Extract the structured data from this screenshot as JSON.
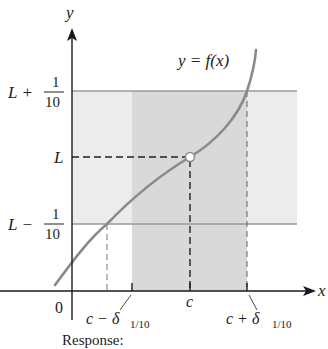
{
  "diagram": {
    "axes": {
      "x_label": "x",
      "y_label": "y",
      "origin_label": "0"
    },
    "curve_label": "y = f(x)",
    "y_levels": {
      "upper": {
        "prefix": "L +",
        "num": "1",
        "den": "10"
      },
      "middle": {
        "label": "L"
      },
      "lower": {
        "prefix": "L −",
        "num": "1",
        "den": "10"
      }
    },
    "x_marks": {
      "left": {
        "label": "c − δ",
        "sub": "1/10"
      },
      "center": {
        "label": "c"
      },
      "right": {
        "label": "c + δ",
        "sub": "1/10"
      }
    },
    "colors": {
      "band_light": "#ebebeb",
      "band_dark": "#d6d6d6",
      "curve": "#8a8a8a",
      "axis": "#1a1a1a",
      "band_line": "#9a9a9a"
    }
  },
  "footer": {
    "response_label": "Response:"
  }
}
